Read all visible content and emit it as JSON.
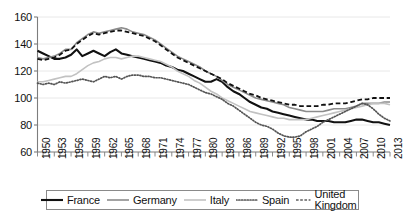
{
  "chart_data": {
    "type": "line",
    "title": "",
    "xlabel": "",
    "ylabel": "",
    "grid": true,
    "legend_position": "bottom",
    "xlim": [
      1950,
      2013
    ],
    "ylim": [
      60,
      160
    ],
    "yticks": [
      60,
      80,
      100,
      120,
      140,
      160
    ],
    "x": [
      1950,
      1951,
      1952,
      1953,
      1954,
      1955,
      1956,
      1957,
      1958,
      1959,
      1960,
      1961,
      1962,
      1963,
      1964,
      1965,
      1966,
      1967,
      1968,
      1969,
      1970,
      1971,
      1972,
      1973,
      1974,
      1975,
      1976,
      1977,
      1978,
      1979,
      1980,
      1981,
      1982,
      1983,
      1984,
      1985,
      1986,
      1987,
      1988,
      1989,
      1990,
      1991,
      1992,
      1993,
      1994,
      1995,
      1996,
      1997,
      1998,
      1999,
      2000,
      2001,
      2002,
      2003,
      2004,
      2005,
      2006,
      2007,
      2008,
      2009,
      2010,
      2011,
      2012,
      2013
    ],
    "xtick_labels": [
      "1950",
      "1953",
      "1956",
      "1959",
      "1962",
      "1965",
      "1968",
      "1971",
      "1974",
      "1977",
      "1980",
      "1983",
      "1986",
      "1989",
      "1992",
      "1995",
      "1998",
      "2001",
      "2004",
      "2007",
      "2010",
      "2013"
    ],
    "xtick_step_years": 3,
    "series": [
      {
        "name": "France",
        "color": "#111111",
        "style": "solid",
        "width": 2.1,
        "values": [
          135,
          133,
          131,
          129,
          129,
          130,
          132,
          136,
          131,
          133,
          135,
          133,
          131,
          134,
          136,
          133,
          132,
          131,
          130,
          129,
          128,
          127,
          126,
          124,
          123,
          121,
          120,
          118,
          116,
          114,
          112,
          112,
          114,
          112,
          108,
          105,
          103,
          100,
          97,
          95,
          93,
          92,
          90,
          89,
          88,
          87,
          86,
          85,
          84,
          84,
          83,
          83,
          83,
          82,
          82,
          82,
          83,
          84,
          84,
          83,
          82,
          82,
          81,
          80
        ]
      },
      {
        "name": "Germany",
        "color": "#8c8c8c",
        "style": "solid",
        "width": 1.6,
        "values": [
          130,
          129,
          130,
          131,
          133,
          136,
          136,
          141,
          144,
          147,
          149,
          148,
          149,
          150,
          151,
          152,
          151,
          149,
          148,
          147,
          145,
          143,
          140,
          137,
          134,
          131,
          129,
          127,
          125,
          123,
          120,
          118,
          116,
          113,
          110,
          108,
          106,
          104,
          102,
          100,
          99,
          98,
          97,
          96,
          95,
          93,
          92,
          91,
          90,
          90,
          90,
          90,
          91,
          92,
          92,
          92,
          93,
          94,
          96,
          96,
          96,
          96,
          97,
          97
        ]
      },
      {
        "name": "Italy",
        "color": "#c2c2c2",
        "style": "solid",
        "width": 1.6,
        "values": [
          112,
          112,
          113,
          114,
          115,
          116,
          116,
          118,
          121,
          124,
          126,
          127,
          129,
          130,
          130,
          129,
          130,
          131,
          131,
          130,
          129,
          128,
          127,
          125,
          123,
          120,
          118,
          116,
          113,
          111,
          108,
          105,
          103,
          100,
          98,
          96,
          94,
          92,
          90,
          89,
          88,
          87,
          86,
          85,
          85,
          84,
          84,
          84,
          84,
          85,
          86,
          87,
          88,
          89,
          90,
          91,
          92,
          93,
          94,
          95,
          96,
          96,
          96,
          95
        ]
      },
      {
        "name": "Spain",
        "color": "#555555",
        "style": "dotted",
        "width": 1.7,
        "values": [
          111,
          110,
          111,
          110,
          112,
          111,
          112,
          113,
          114,
          113,
          112,
          114,
          116,
          115,
          116,
          114,
          116,
          117,
          117,
          116,
          116,
          115,
          115,
          114,
          113,
          112,
          111,
          110,
          108,
          106,
          104,
          103,
          101,
          99,
          96,
          94,
          91,
          88,
          85,
          82,
          80,
          79,
          77,
          74,
          72,
          71,
          71,
          72,
          75,
          77,
          79,
          82,
          84,
          86,
          88,
          90,
          92,
          94,
          96,
          95,
          92,
          88,
          85,
          83
        ]
      },
      {
        "name": "United Kingdom",
        "color": "#111111",
        "style": "dashed",
        "width": 1.8,
        "values": [
          129,
          128,
          129,
          130,
          132,
          135,
          136,
          140,
          143,
          146,
          148,
          147,
          148,
          149,
          150,
          150,
          149,
          148,
          147,
          146,
          144,
          142,
          139,
          136,
          133,
          130,
          128,
          126,
          124,
          122,
          120,
          118,
          116,
          114,
          111,
          109,
          107,
          105,
          103,
          102,
          100,
          99,
          98,
          97,
          96,
          95,
          95,
          94,
          94,
          94,
          94,
          95,
          95,
          96,
          96,
          96,
          97,
          98,
          99,
          99,
          100,
          100,
          100,
          100
        ]
      }
    ]
  },
  "axes": {
    "y_labels": [
      "160",
      "140",
      "120",
      "100",
      "80",
      "60"
    ]
  },
  "legend": {
    "items": [
      {
        "label": "France"
      },
      {
        "label": "Germany"
      },
      {
        "label": "Italy"
      },
      {
        "label": "Spain"
      },
      {
        "label": "United Kingdom"
      }
    ]
  }
}
